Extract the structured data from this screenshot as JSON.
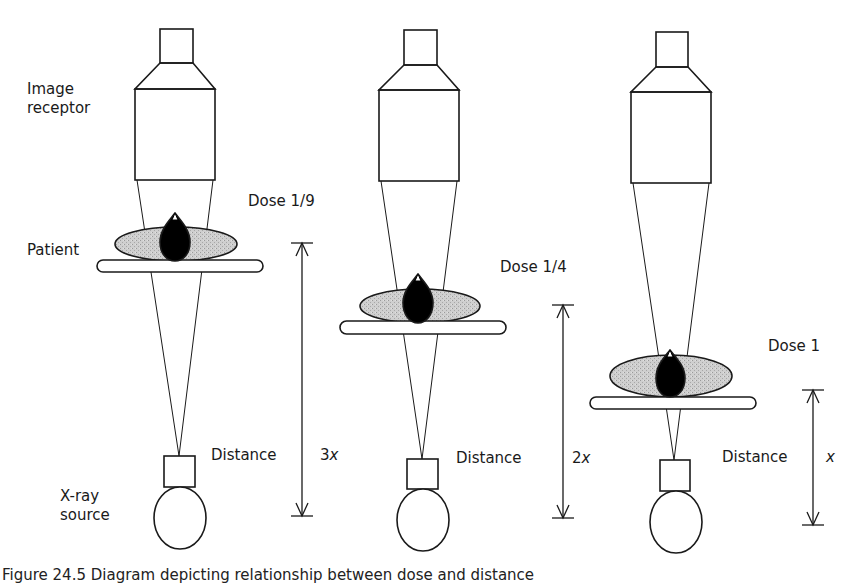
{
  "labels": {
    "image_receptor_line1": "Image",
    "image_receptor_line2": "receptor",
    "patient": "Patient",
    "xray_source_line1": "X-ray",
    "xray_source_line2": "source"
  },
  "panels": [
    {
      "dose": "Dose 1/9",
      "distance_label": "Distance",
      "distance_value": "3x",
      "distance_factor": "3",
      "distance_var": "x"
    },
    {
      "dose": "Dose 1/4",
      "distance_label": "Distance",
      "distance_value": "2x",
      "distance_factor": "2",
      "distance_var": "x"
    },
    {
      "dose": "Dose 1",
      "distance_label": "Distance",
      "distance_value": "x",
      "distance_factor": "",
      "distance_var": "x"
    }
  ],
  "caption": "Figure 24.5 Diagram depicting relationship between dose and distance",
  "colors": {
    "stroke": "#1a1a1a",
    "patient_fill": "#c8c8c8",
    "organ_fill": "#000000",
    "background": "#ffffff"
  }
}
